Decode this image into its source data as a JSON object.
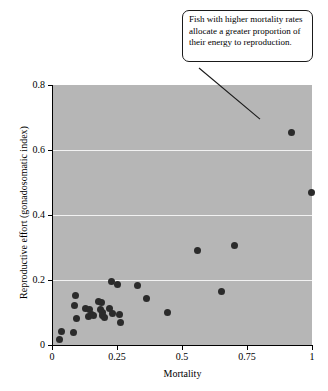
{
  "chart_data": {
    "type": "scatter",
    "title": "",
    "xlabel": "Mortality",
    "ylabel": "Reproductive effort (gonadosomatic index)",
    "xlim": [
      0,
      1
    ],
    "ylim": [
      0,
      0.8
    ],
    "xticks": [
      "0",
      "0.25",
      "0.5",
      "0.75",
      "1"
    ],
    "xtick_values": [
      0,
      0.25,
      0.5,
      0.75,
      1
    ],
    "yticks": [
      "0",
      "0.2",
      "0.4",
      "0.6",
      "0.8"
    ],
    "ytick_values": [
      0,
      0.2,
      0.4,
      0.6,
      0.8
    ],
    "grid": "horizontal-white-gridlines-at-y-0.2-0.4-0.6",
    "legend": "none",
    "plot_background_color": "#b6b6b6",
    "gridline_color": "#f2f2f2",
    "point_color": "#2b2b2b",
    "points": [
      {
        "x": 0.03,
        "y": 0.016
      },
      {
        "x": 0.038,
        "y": 0.043
      },
      {
        "x": 0.082,
        "y": 0.04
      },
      {
        "x": 0.09,
        "y": 0.152
      },
      {
        "x": 0.088,
        "y": 0.121
      },
      {
        "x": 0.093,
        "y": 0.082
      },
      {
        "x": 0.13,
        "y": 0.112
      },
      {
        "x": 0.143,
        "y": 0.108
      },
      {
        "x": 0.14,
        "y": 0.088
      },
      {
        "x": 0.15,
        "y": 0.095
      },
      {
        "x": 0.16,
        "y": 0.09
      },
      {
        "x": 0.178,
        "y": 0.133
      },
      {
        "x": 0.19,
        "y": 0.131
      },
      {
        "x": 0.185,
        "y": 0.108
      },
      {
        "x": 0.193,
        "y": 0.1
      },
      {
        "x": 0.196,
        "y": 0.09
      },
      {
        "x": 0.2,
        "y": 0.085
      },
      {
        "x": 0.228,
        "y": 0.196
      },
      {
        "x": 0.222,
        "y": 0.112
      },
      {
        "x": 0.232,
        "y": 0.098
      },
      {
        "x": 0.253,
        "y": 0.186
      },
      {
        "x": 0.258,
        "y": 0.093
      },
      {
        "x": 0.262,
        "y": 0.07
      },
      {
        "x": 0.33,
        "y": 0.184
      },
      {
        "x": 0.365,
        "y": 0.143
      },
      {
        "x": 0.443,
        "y": 0.1
      },
      {
        "x": 0.56,
        "y": 0.29
      },
      {
        "x": 0.65,
        "y": 0.165
      },
      {
        "x": 0.7,
        "y": 0.305
      },
      {
        "x": 0.92,
        "y": 0.655
      },
      {
        "x": 0.998,
        "y": 0.47
      }
    ],
    "annotations": [
      {
        "text": "Fish with higher mortality rates allocate a greater proportion of their energy to reproduction.",
        "points_to_x": 0.8,
        "points_to_y": 0.695
      }
    ]
  }
}
